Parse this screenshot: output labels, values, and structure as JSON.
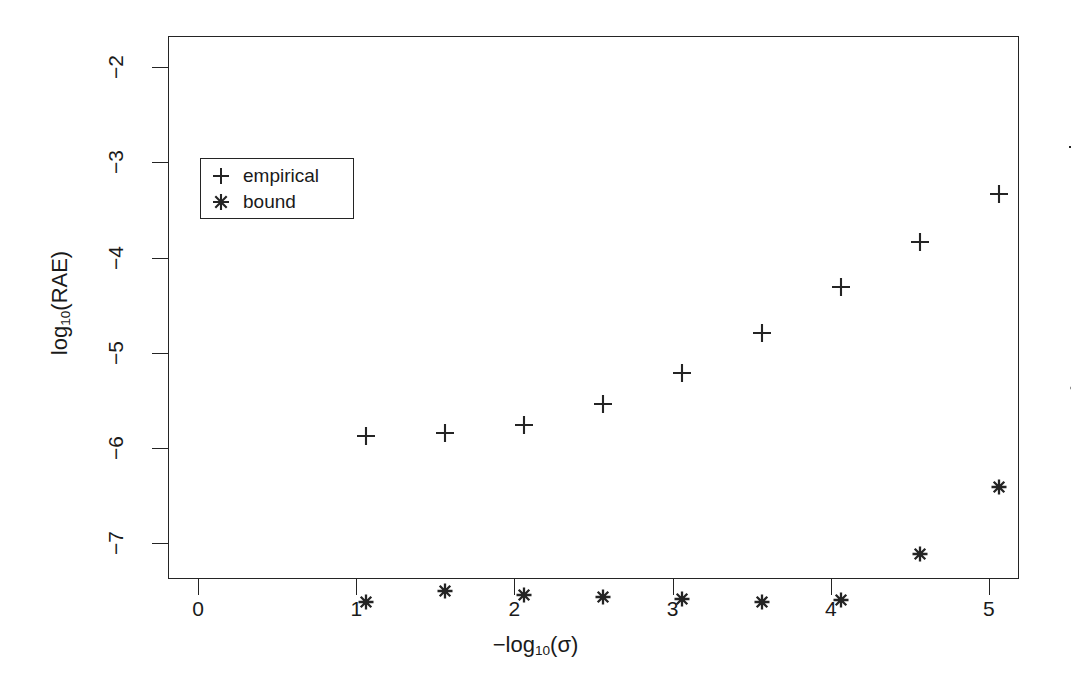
{
  "figure": {
    "background": "#ffffff",
    "ink_color": "#242424",
    "axis_title_x": "−log",
    "axis_title_x_sub": "10",
    "axis_title_x_tail": "(σ)",
    "axis_title_y": "log",
    "axis_title_y_sub": "10",
    "axis_title_y_tail": "(RAE)"
  },
  "legend": {
    "position": "upper-left-inside",
    "entries": [
      {
        "marker": "plus-marker",
        "label": "empirical"
      },
      {
        "marker": "asterisk-marker",
        "label": "bound"
      }
    ]
  },
  "chart_data": {
    "type": "scatter",
    "title": "",
    "xlabel": "-log10(sigma)",
    "ylabel": "log10(RAE)",
    "xlim": [
      -0.19,
      5.19
    ],
    "ylim": [
      -7.38,
      -1.67
    ],
    "xticks": [
      0,
      1,
      2,
      3,
      4,
      5
    ],
    "xtick_labels": [
      "0",
      "1",
      "2",
      "3",
      "4",
      "5"
    ],
    "yticks": [
      -2,
      -3,
      -4,
      -5,
      -6,
      -7
    ],
    "ytick_labels": [
      "-2",
      "-3",
      "-4",
      "-5",
      "-6",
      "-7"
    ],
    "grid": false,
    "legend_position": "upper left",
    "x": [
      0,
      0.5,
      1,
      1.5,
      2,
      2.5,
      3,
      3.5,
      4,
      4.5,
      5
    ],
    "series": [
      {
        "name": "empirical",
        "marker": "+",
        "values": [
          -5.5,
          -5.47,
          -5.38,
          -5.16,
          -4.83,
          -4.41,
          -3.93,
          -3.46,
          -2.95,
          -2.46,
          -1.95
        ]
      },
      {
        "name": "bound",
        "marker": "*",
        "values": [
          -7.24,
          -7.13,
          -7.17,
          -7.19,
          -7.21,
          -7.24,
          -7.22,
          -6.74,
          -6.03,
          -4.99,
          -4.1
        ]
      }
    ]
  }
}
